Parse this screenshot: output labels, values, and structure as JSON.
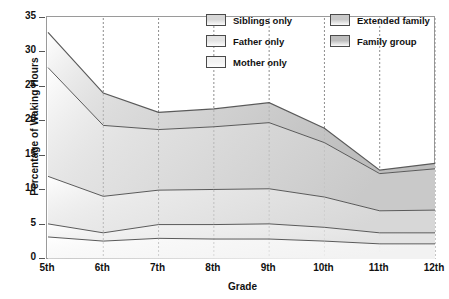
{
  "chart_data": {
    "type": "area",
    "stacked": true,
    "title": "",
    "xlabel": "Grade",
    "ylabel": "Percentage of Waking Hours",
    "categories": [
      "5th",
      "6th",
      "7th",
      "8th",
      "9th",
      "10th",
      "11th",
      "12th"
    ],
    "x": [
      "5th",
      "6th",
      "7th",
      "8th",
      "9th",
      "10th",
      "11th",
      "12th"
    ],
    "ylim": [
      0,
      35
    ],
    "yticks": [
      0,
      5,
      10,
      15,
      20,
      25,
      30,
      35
    ],
    "ytick_labels": [
      "0",
      "5",
      "10",
      "15",
      "20",
      "25",
      "30",
      "35"
    ],
    "grid": "vertical-dotted",
    "legend_position": "top-right-inside",
    "series": [
      {
        "name": "Mother only",
        "color": "#f2f2f2",
        "values": [
          3.2,
          2.6,
          3.0,
          2.9,
          2.9,
          2.6,
          2.2,
          2.2
        ]
      },
      {
        "name": "Father only",
        "color": "#e3e3e3",
        "values": [
          1.9,
          1.2,
          2.0,
          2.1,
          2.2,
          2.0,
          1.6,
          1.6
        ]
      },
      {
        "name": "Siblings only",
        "color": "#d7d7d7",
        "values": [
          6.9,
          5.3,
          5.0,
          5.1,
          5.1,
          4.4,
          3.2,
          3.3
        ]
      },
      {
        "name": "Extended family",
        "color": "#c9c9c9",
        "values": [
          15.8,
          10.3,
          8.8,
          9.1,
          9.6,
          7.9,
          5.4,
          6.0
        ]
      },
      {
        "name": "Family group",
        "color": "#bdbdbd",
        "values": [
          5.1,
          4.7,
          2.5,
          2.6,
          2.9,
          2.1,
          0.5,
          0.8
        ]
      }
    ],
    "cumulative_tops": {
      "mother_only": [
        3.2,
        2.6,
        3.0,
        2.9,
        2.9,
        2.6,
        2.2,
        2.2
      ],
      "father_only": [
        5.1,
        3.8,
        5.0,
        5.0,
        5.1,
        4.6,
        3.8,
        3.8
      ],
      "siblings_only": [
        12.0,
        9.1,
        10.0,
        10.1,
        10.2,
        9.0,
        7.0,
        7.1
      ],
      "extended_family": [
        27.8,
        19.4,
        18.8,
        19.2,
        19.8,
        16.9,
        12.4,
        13.1
      ],
      "family_group": [
        32.9,
        24.1,
        21.3,
        21.8,
        22.7,
        19.0,
        12.9,
        13.9
      ]
    }
  },
  "legend": {
    "items": [
      {
        "label": "Siblings only",
        "color": "#d7d7d7"
      },
      {
        "label": "Extended family",
        "color": "#c9c9c9"
      },
      {
        "label": "Father only",
        "color": "#e3e3e3"
      },
      {
        "label": "Family group",
        "color": "#bdbdbd"
      },
      {
        "label": "Mother only",
        "color": "#f2f2f2"
      }
    ]
  },
  "axes": {
    "x_title": "Grade",
    "y_title": "Percentage of Waking Hours",
    "y_ticks": [
      "0",
      "5",
      "10",
      "15",
      "20",
      "25",
      "30",
      "35"
    ],
    "x_ticks": [
      "5th",
      "6th",
      "7th",
      "8th",
      "9th",
      "10th",
      "11th",
      "12th"
    ]
  },
  "style": {
    "line_color": "#5a5a5a",
    "frame_color": "#9a9a9a",
    "grid_color": "#8d8d8d",
    "text_color": "#111111"
  }
}
